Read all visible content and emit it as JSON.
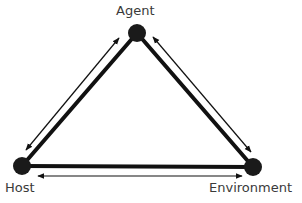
{
  "diagram": {
    "type": "triangle-relationship",
    "nodes": [
      {
        "id": "agent",
        "label": "Agent",
        "x": 137,
        "y": 33
      },
      {
        "id": "host",
        "label": "Host",
        "x": 22,
        "y": 166
      },
      {
        "id": "environment",
        "label": "Environment",
        "x": 253,
        "y": 167
      }
    ],
    "edges": [
      {
        "from": "agent",
        "to": "host",
        "bidirectional": true
      },
      {
        "from": "agent",
        "to": "environment",
        "bidirectional": true
      },
      {
        "from": "host",
        "to": "environment",
        "bidirectional": true
      }
    ],
    "colors": {
      "edge": "#111111",
      "node": "#1a1a1a",
      "label": "#3a3a3a"
    }
  }
}
